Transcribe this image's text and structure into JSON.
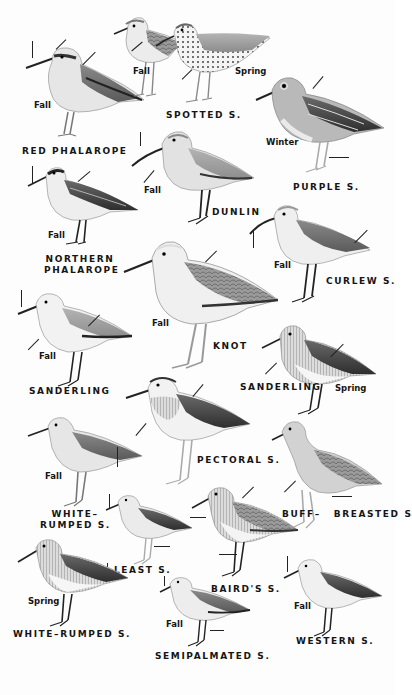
{
  "plate": {
    "description": "Field guide plate of sandpipers and phalaropes",
    "background": "#fdfdfd",
    "ink": "#151515"
  },
  "birds": [
    {
      "id": "red-phalarope",
      "name": "RED PHALAROPE",
      "season": "Fall"
    },
    {
      "id": "spotted-fall",
      "name": "",
      "season": "Fall"
    },
    {
      "id": "spotted-spring",
      "name": "SPOTTED S.",
      "season": "Spring"
    },
    {
      "id": "purple",
      "name": "PURPLE S.",
      "season": "Winter"
    },
    {
      "id": "northern-phalarope",
      "name_line1": "NORTHERN",
      "name_line2": "PHALAROPE",
      "season": "Fall"
    },
    {
      "id": "dunlin",
      "name": "DUNLIN",
      "season": "Fall"
    },
    {
      "id": "curlew",
      "name": "CURLEW S.",
      "season": "Fall"
    },
    {
      "id": "knot",
      "name": "KNOT",
      "season": "Fall"
    },
    {
      "id": "sanderling-fall",
      "name": "SANDERLING",
      "season": "Fall"
    },
    {
      "id": "sanderling-spring",
      "name": "SANDERLING",
      "season": "Spring"
    },
    {
      "id": "white-rumped-fall",
      "name_line1": "WHITE–",
      "name_line2": "RUMPED S.",
      "season": "Fall"
    },
    {
      "id": "pectoral",
      "name": "PECTORAL S.",
      "season": ""
    },
    {
      "id": "buff-breasted",
      "name_line1": "BUFF–",
      "name_line2": "BREASTED S",
      "season": ""
    },
    {
      "id": "least",
      "name": "LEAST S.",
      "season": ""
    },
    {
      "id": "bairds",
      "name": "BAIRD'S S.",
      "season": ""
    },
    {
      "id": "white-rumped-spring",
      "name": "WHITE–RUMPED S.",
      "season": "Spring"
    },
    {
      "id": "semipalmated",
      "name": "SEMIPALMATED S.",
      "season": "Fall"
    },
    {
      "id": "western",
      "name": "WESTERN S.",
      "season": "Fall"
    }
  ]
}
